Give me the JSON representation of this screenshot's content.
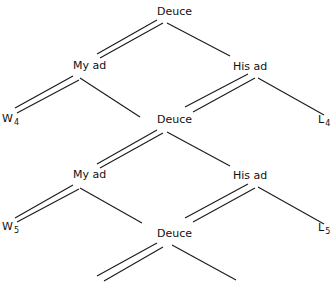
{
  "diagram": {
    "type": "tree",
    "nodes": [
      {
        "id": "deuce1",
        "label": "Deuce",
        "x": 157,
        "y": 6
      },
      {
        "id": "myad1",
        "label": "My ad",
        "x": 73,
        "y": 60
      },
      {
        "id": "hisad1",
        "label": "His ad",
        "x": 233,
        "y": 61
      },
      {
        "id": "w4",
        "label": "W",
        "sub": "4",
        "x": 2,
        "y": 113
      },
      {
        "id": "deuce2",
        "label": "Deuce",
        "x": 157,
        "y": 114
      },
      {
        "id": "l4",
        "label": "L",
        "sub": "4",
        "x": 318,
        "y": 114
      },
      {
        "id": "myad2",
        "label": "My ad",
        "x": 73,
        "y": 169
      },
      {
        "id": "hisad2",
        "label": "His ad",
        "x": 233,
        "y": 170
      },
      {
        "id": "w5",
        "label": "W",
        "sub": "5",
        "x": 2,
        "y": 221
      },
      {
        "id": "deuce3",
        "label": "Deuce",
        "x": 157,
        "y": 228
      },
      {
        "id": "l5",
        "label": "L",
        "sub": "5",
        "x": 318,
        "y": 222
      }
    ],
    "edges": [
      {
        "from": "deuce1",
        "to": "myad1",
        "style": "double"
      },
      {
        "from": "deuce1",
        "to": "hisad1",
        "style": "single"
      },
      {
        "from": "myad1",
        "to": "w4",
        "style": "double"
      },
      {
        "from": "myad1",
        "to": "deuce2",
        "style": "single"
      },
      {
        "from": "hisad1",
        "to": "deuce2",
        "style": "double"
      },
      {
        "from": "hisad1",
        "to": "l4",
        "style": "single"
      },
      {
        "from": "deuce2",
        "to": "myad2",
        "style": "double"
      },
      {
        "from": "deuce2",
        "to": "hisad2",
        "style": "single"
      },
      {
        "from": "myad2",
        "to": "w5",
        "style": "double"
      },
      {
        "from": "myad2",
        "to": "deuce3",
        "style": "single"
      },
      {
        "from": "hisad2",
        "to": "deuce3",
        "style": "double"
      },
      {
        "from": "hisad2",
        "to": "l5",
        "style": "single"
      },
      {
        "from": "deuce3",
        "to": "(continues)",
        "style": "double"
      },
      {
        "from": "deuce3",
        "to": "(continues)",
        "style": "single"
      }
    ]
  }
}
